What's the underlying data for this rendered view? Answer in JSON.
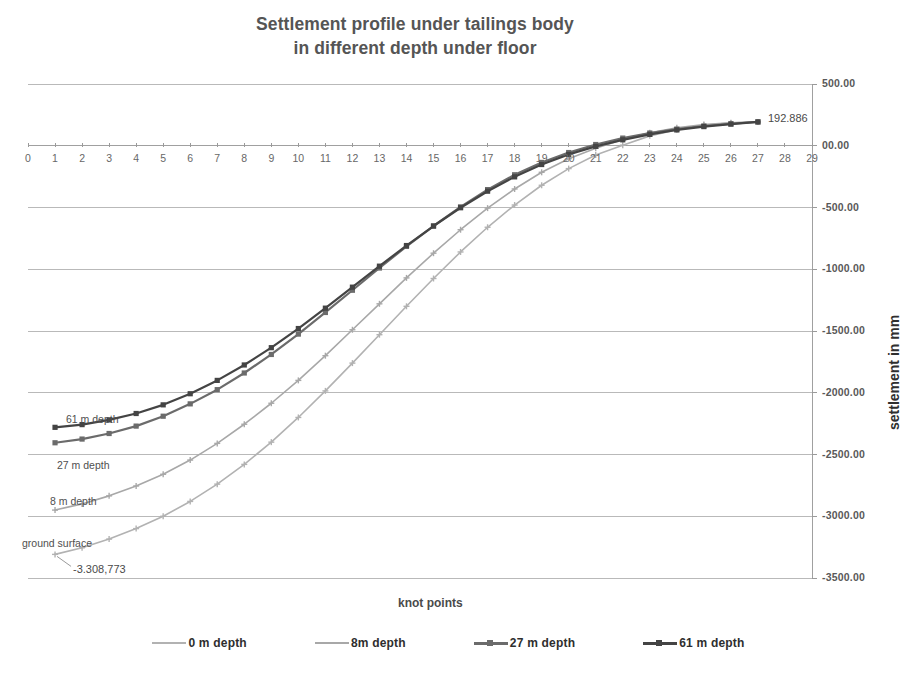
{
  "chart_data": {
    "type": "line",
    "title": "Settlement profile under tailings body in different depth under floor",
    "title_line1": "Settlement profile under tailings body",
    "title_line2": "in different depth under floor",
    "xlabel": "knot points",
    "ylabel": "settlement in mm",
    "xlim": [
      0,
      29
    ],
    "ylim": [
      -3500,
      500
    ],
    "grid": true,
    "legend_position": "bottom",
    "x_ticks": [
      0,
      1,
      2,
      3,
      4,
      5,
      6,
      7,
      8,
      9,
      10,
      11,
      12,
      13,
      14,
      15,
      16,
      17,
      18,
      19,
      20,
      21,
      22,
      23,
      24,
      25,
      26,
      27,
      28,
      29
    ],
    "y_ticks": [
      500,
      0,
      -500,
      -1000,
      -1500,
      -2000,
      -2500,
      -3000,
      -3500
    ],
    "y_tick_labels": [
      "500.00",
      "00.00",
      "-500.00",
      "-1000.00",
      "-1500.00",
      "-2000.00",
      "-2500.00",
      "-3000.00",
      "-3500.00"
    ],
    "x": [
      1,
      2,
      3,
      4,
      5,
      6,
      7,
      8,
      9,
      10,
      11,
      12,
      13,
      14,
      15,
      16,
      17,
      18,
      19,
      20,
      21,
      22,
      23,
      24,
      25,
      26,
      27
    ],
    "series": [
      {
        "name": "0 m  depth",
        "legend_label": "0 m  depth",
        "annotation": "ground surface",
        "color": "#b2b2b2",
        "marker": "cross",
        "values": [
          -3308.773,
          -3255.0,
          -3185.0,
          -3100.0,
          -3000.0,
          -2880.0,
          -2740.0,
          -2580.0,
          -2400.0,
          -2200.0,
          -1985.0,
          -1760.0,
          -1530.0,
          -1300.0,
          -1075.0,
          -860.0,
          -660.0,
          -480.0,
          -320.0,
          -185.0,
          -75.0,
          5.0,
          80.0,
          130.0,
          165.0,
          185.0,
          192.886
        ]
      },
      {
        "name": "8m  depth",
        "legend_label": "8m  depth",
        "annotation": "8 m depth",
        "color": "#a8a8a8",
        "marker": "cross",
        "values": [
          -2950.0,
          -2900.0,
          -2835.0,
          -2755.0,
          -2660.0,
          -2545.0,
          -2410.0,
          -2255.0,
          -2085.0,
          -1900.0,
          -1700.0,
          -1490.0,
          -1280.0,
          -1070.0,
          -870.0,
          -680.0,
          -505.0,
          -350.0,
          -215.0,
          -105.0,
          -20.0,
          50.0,
          105.0,
          145.0,
          172.0,
          186.0,
          192.886
        ]
      },
      {
        "name": "27 m  depth",
        "legend_label": "27 m  depth",
        "annotation": "27 m depth",
        "color": "#6b6b6b",
        "marker": "square",
        "values": [
          -2405.0,
          -2375.0,
          -2330.0,
          -2270.0,
          -2190.0,
          -2090.0,
          -1975.0,
          -1840.0,
          -1690.0,
          -1525.0,
          -1350.0,
          -1170.0,
          -990.0,
          -815.0,
          -650.0,
          -495.0,
          -355.0,
          -235.0,
          -135.0,
          -55.0,
          10.0,
          62.0,
          103.0,
          135.0,
          160.0,
          178.0,
          192.886
        ]
      },
      {
        "name": "61 m  depth",
        "legend_label": "61 m  depth",
        "annotation": "61 m depth",
        "color": "#444444",
        "marker": "square",
        "values": [
          -2280.0,
          -2258.0,
          -2220.0,
          -2168.0,
          -2098.0,
          -2008.0,
          -1900.0,
          -1775.0,
          -1635.0,
          -1480.0,
          -1315.0,
          -1145.0,
          -975.0,
          -808.0,
          -650.0,
          -502.0,
          -368.0,
          -252.0,
          -152.0,
          -70.0,
          -5.0,
          48.0,
          92.0,
          128.0,
          155.0,
          175.0,
          192.886
        ]
      }
    ],
    "annotations": [
      {
        "text": "192.886",
        "series": "61 m  depth",
        "at_x": 27,
        "at_y": 192.886
      },
      {
        "text": "-3.308,773",
        "series": "0 m  depth",
        "at_x": 1,
        "at_y": -3308.773
      }
    ]
  }
}
